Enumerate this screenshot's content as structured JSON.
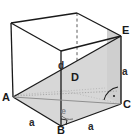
{
  "figure": {
    "background_color": "#ffffff",
    "stroke_color": "#1a1a1a",
    "shade_color": "#d5d5d5",
    "shade_color_light": "#e8e8e8",
    "shade_color_right": "#cfcfcf",
    "dash_color": "#555555",
    "vertices": [
      {
        "id": "A",
        "label": "A",
        "x": 13,
        "y": 97
      },
      {
        "id": "B",
        "label": "B",
        "x": 61,
        "y": 126
      },
      {
        "id": "C",
        "label": "C",
        "x": 121,
        "y": 104
      },
      {
        "id": "D",
        "label": "D",
        "x": 75,
        "y": 76
      },
      {
        "id": "E",
        "label": "E",
        "x": 121,
        "y": 36
      }
    ],
    "measures": [
      {
        "id": "edge-ab",
        "label": "a",
        "x": 33,
        "y": 122
      },
      {
        "id": "edge-bc",
        "label": "a",
        "x": 92,
        "y": 126
      },
      {
        "id": "edge-ce",
        "label": "a",
        "x": 124,
        "y": 72
      },
      {
        "id": "diagonal-d",
        "label": "d",
        "x": 61,
        "y": 65
      },
      {
        "id": "angle-e",
        "label": "e",
        "x": 64,
        "y": 110
      }
    ],
    "angle_marks": [
      {
        "id": "right-angle-at-c",
        "type": "right-angle",
        "vertex": "C"
      },
      {
        "id": "right-angle-at-b",
        "type": "right-angle",
        "vertex": "B"
      },
      {
        "id": "arc-at-b",
        "type": "arc",
        "vertex": "B"
      },
      {
        "id": "arc-at-c",
        "type": "arc",
        "vertex": "C"
      }
    ]
  }
}
